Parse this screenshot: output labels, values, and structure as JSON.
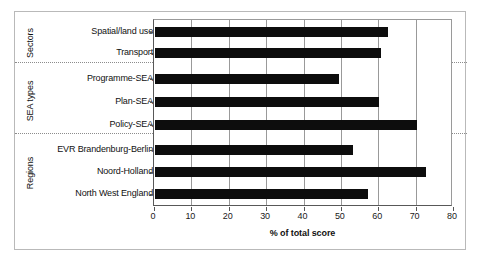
{
  "chart_data": {
    "type": "bar",
    "orientation": "horizontal",
    "title": "",
    "xlabel": "% of total score",
    "ylabel": "",
    "xlim": [
      0,
      80
    ],
    "xticks": [
      0,
      10,
      20,
      30,
      40,
      50,
      60,
      70,
      80
    ],
    "xtick_labels": [
      "0",
      "10",
      "20",
      "30",
      "40",
      "50",
      "60",
      "70",
      "80"
    ],
    "grid": true,
    "grid_axis": "x",
    "legend": false,
    "bar_color": "#0d0d0d",
    "categories": [
      "Spatial/land use",
      "Transport",
      "Programme-SEA",
      "Plan-SEA",
      "Policy-SEA",
      "EVR Brandenburg-Berlin",
      "Noord-Holland",
      "North West England"
    ],
    "values": [
      62.3,
      60.4,
      49.3,
      60.0,
      70.1,
      53.1,
      72.5,
      56.9
    ],
    "groups": [
      {
        "label": "Sectors",
        "categories": [
          "Spatial/land use",
          "Transport"
        ]
      },
      {
        "label": "SEA types",
        "categories": [
          "Programme-SEA",
          "Plan-SEA",
          "Policy-SEA"
        ]
      },
      {
        "label": "Regions",
        "categories": [
          "EVR Brandenburg-Berlin",
          "Noord-Holland",
          "North West England"
        ]
      }
    ]
  },
  "axis": {
    "title": "% of total score",
    "ticks": [
      {
        "value": 0,
        "label": "0"
      },
      {
        "value": 10,
        "label": "10"
      },
      {
        "value": 20,
        "label": "20"
      },
      {
        "value": 30,
        "label": "30"
      },
      {
        "value": 40,
        "label": "40"
      },
      {
        "value": 50,
        "label": "50"
      },
      {
        "value": 60,
        "label": "60"
      },
      {
        "value": 70,
        "label": "70"
      },
      {
        "value": 80,
        "label": "80"
      }
    ]
  },
  "groups": [
    {
      "label": "Sectors"
    },
    {
      "label": "SEA types"
    },
    {
      "label": "Regions"
    }
  ],
  "bars": [
    {
      "label": "Spatial/land use",
      "value": 62.3
    },
    {
      "label": "Transport",
      "value": 60.4
    },
    {
      "label": "Programme-SEA",
      "value": 49.3
    },
    {
      "label": "Plan-SEA",
      "value": 60.0
    },
    {
      "label": "Policy-SEA",
      "value": 70.1
    },
    {
      "label": "EVR Brandenburg-Berlin",
      "value": 53.1
    },
    {
      "label": "Noord-Holland",
      "value": 72.5
    },
    {
      "label": "North West England",
      "value": 56.9
    }
  ]
}
